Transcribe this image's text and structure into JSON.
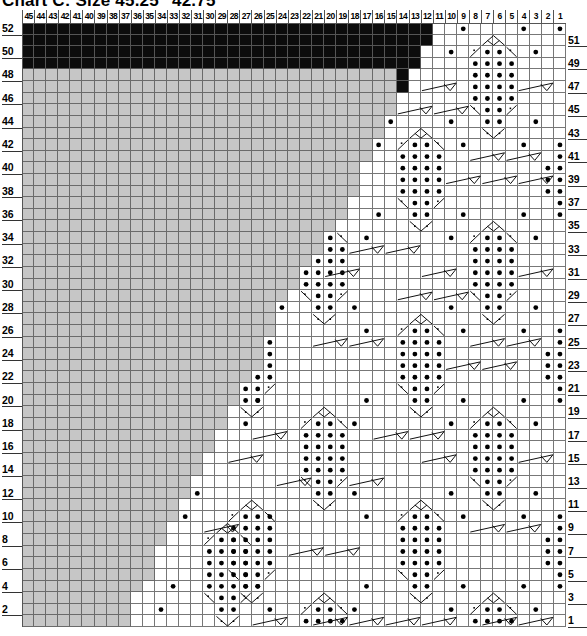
{
  "title": "Chart C: Size 45.25\" 42.75\"",
  "chart_data": {
    "type": "table",
    "subtype": "knitting-chart",
    "title": "Chart C: Size 45.25\" 42.75\"",
    "columns": 45,
    "rows": 52,
    "column_labels": [
      45,
      44,
      43,
      42,
      41,
      40,
      39,
      38,
      37,
      36,
      35,
      34,
      33,
      32,
      31,
      30,
      29,
      28,
      27,
      26,
      25,
      24,
      23,
      22,
      21,
      20,
      19,
      18,
      17,
      16,
      15,
      14,
      13,
      12,
      11,
      10,
      9,
      8,
      7,
      6,
      5,
      4,
      3,
      2,
      1
    ],
    "row_labels_left": [
      52,
      50,
      48,
      46,
      44,
      42,
      40,
      38,
      36,
      34,
      32,
      30,
      28,
      26,
      24,
      22,
      20,
      18,
      16,
      14,
      12,
      10,
      8,
      6,
      4,
      2
    ],
    "row_labels_right": [
      51,
      49,
      47,
      45,
      43,
      41,
      39,
      37,
      35,
      33,
      31,
      29,
      27,
      25,
      23,
      21,
      19,
      17,
      15,
      13,
      11,
      9,
      7,
      5,
      3,
      1
    ],
    "legend_colors": {
      "no_stitch_gray": "#c6c6c6",
      "black_bind_off": "#0c0c0c",
      "grid_line": "#777777",
      "stitch_bg": "#ffffff"
    },
    "black_cells": [
      {
        "row": 52,
        "from_col": 45,
        "to_col": 12
      },
      {
        "row": 51,
        "from_col": 45,
        "to_col": 12
      },
      {
        "row": 50,
        "from_col": 45,
        "to_col": 13
      },
      {
        "row": 49,
        "from_col": 45,
        "to_col": 13
      },
      {
        "row": 48,
        "from_col": 14,
        "to_col": 14
      },
      {
        "row": 47,
        "from_col": 14,
        "to_col": 14
      }
    ],
    "gray_through_col_by_row": {
      "48": 15,
      "47": 15,
      "46": 15,
      "45": 15,
      "44": 16,
      "43": 16,
      "42": 17,
      "41": 17,
      "40": 18,
      "39": 18,
      "38": 18,
      "37": 19,
      "36": 19,
      "35": 20,
      "34": 21,
      "33": 21,
      "32": 22,
      "31": 23,
      "30": 23,
      "29": 24,
      "28": 25,
      "27": 25,
      "26": 25,
      "25": 26,
      "24": 26,
      "23": 26,
      "22": 27,
      "21": 28,
      "20": 28,
      "19": 29,
      "18": 29,
      "17": 30,
      "16": 30,
      "15": 31,
      "14": 31,
      "13": 32,
      "12": 32,
      "11": 33,
      "10": 33,
      "9": 34,
      "8": 34,
      "7": 35,
      "6": 35,
      "5": 35,
      "4": 36,
      "3": 37,
      "2": 37,
      "1": 37
    },
    "diamond_motifs": [
      {
        "cols": [
          8,
          7,
          6,
          5
        ],
        "top_row": 51
      },
      {
        "cols": [
          8,
          7,
          6,
          5
        ],
        "top_row": 35
      },
      {
        "cols": [
          8,
          7,
          6,
          5
        ],
        "top_row": 19
      },
      {
        "cols": [
          8,
          7,
          6,
          5
        ],
        "top_row": 3
      },
      {
        "cols": [
          14,
          13,
          12,
          11
        ],
        "top_row": 43
      },
      {
        "cols": [
          14,
          13,
          12,
          11
        ],
        "top_row": 27
      },
      {
        "cols": [
          14,
          13,
          12,
          11
        ],
        "top_row": 11
      },
      {
        "cols": [
          22,
          21,
          20,
          19
        ],
        "top_row": 35
      },
      {
        "cols": [
          22,
          21,
          20,
          19
        ],
        "top_row": 19
      },
      {
        "cols": [
          22,
          21,
          20,
          19
        ],
        "top_row": 3
      },
      {
        "cols": [
          28,
          27,
          26,
          25
        ],
        "top_row": 27
      },
      {
        "cols": [
          28,
          27,
          26,
          25
        ],
        "top_row": 11
      },
      {
        "cols": [
          30,
          29,
          28,
          27
        ],
        "top_row": 9
      }
    ],
    "extra_bullets": {
      "52": [
        9,
        4,
        1
      ],
      "50": [
        10,
        3
      ],
      "44": [
        10,
        3,
        15
      ],
      "42": [
        16,
        9,
        4,
        1
      ],
      "41": [
        1
      ],
      "40": [
        2,
        1
      ],
      "39": [
        2,
        1
      ],
      "38": [
        2,
        1
      ],
      "37": [
        1
      ],
      "36": [
        16,
        9,
        4,
        1
      ],
      "34": [
        17,
        10,
        3
      ],
      "28": [
        24,
        18,
        10,
        3
      ],
      "26": [
        25,
        17,
        9,
        4,
        1
      ],
      "25": [
        1
      ],
      "24": [
        2,
        1
      ],
      "23": [
        2,
        1
      ],
      "22": [
        2,
        1
      ],
      "21": [
        1
      ],
      "20": [
        26,
        17,
        9,
        4,
        1
      ],
      "18": [
        27,
        18,
        10,
        3
      ],
      "12": [
        31,
        18,
        10,
        3
      ],
      "10": [
        32,
        25,
        17,
        9,
        4,
        1
      ],
      "9": [
        1
      ],
      "8": [
        2,
        1
      ],
      "7": [
        2,
        1
      ],
      "6": [
        2,
        1
      ],
      "5": [
        1
      ],
      "4": [
        33,
        26,
        17,
        9,
        4,
        1
      ],
      "2": [
        34,
        25,
        18,
        10,
        3
      ]
    },
    "cables": [
      {
        "row": 47,
        "from_col": 12,
        "to_col": 10
      },
      {
        "row": 47,
        "from_col": 4,
        "to_col": 2
      },
      {
        "row": 45,
        "from_col": 14,
        "to_col": 12
      },
      {
        "row": 45,
        "from_col": 11,
        "to_col": 9
      },
      {
        "row": 41,
        "from_col": 8,
        "to_col": 6
      },
      {
        "row": 41,
        "from_col": 5,
        "to_col": 3
      },
      {
        "row": 39,
        "from_col": 10,
        "to_col": 8
      },
      {
        "row": 39,
        "from_col": 7,
        "to_col": 5
      },
      {
        "row": 39,
        "from_col": 4,
        "to_col": 2
      },
      {
        "row": 33,
        "from_col": 18,
        "to_col": 16
      },
      {
        "row": 33,
        "from_col": 15,
        "to_col": 13
      },
      {
        "row": 31,
        "from_col": 12,
        "to_col": 10
      },
      {
        "row": 31,
        "from_col": 4,
        "to_col": 2
      },
      {
        "row": 31,
        "from_col": 20,
        "to_col": 18
      },
      {
        "row": 29,
        "from_col": 14,
        "to_col": 12
      },
      {
        "row": 29,
        "from_col": 11,
        "to_col": 9
      },
      {
        "row": 25,
        "from_col": 8,
        "to_col": 6
      },
      {
        "row": 25,
        "from_col": 5,
        "to_col": 3
      },
      {
        "row": 25,
        "from_col": 21,
        "to_col": 19
      },
      {
        "row": 25,
        "from_col": 18,
        "to_col": 16
      },
      {
        "row": 23,
        "from_col": 10,
        "to_col": 8
      },
      {
        "row": 23,
        "from_col": 7,
        "to_col": 5
      },
      {
        "row": 17,
        "from_col": 26,
        "to_col": 24
      },
      {
        "row": 17,
        "from_col": 16,
        "to_col": 14
      },
      {
        "row": 17,
        "from_col": 13,
        "to_col": 11
      },
      {
        "row": 15,
        "from_col": 28,
        "to_col": 26
      },
      {
        "row": 15,
        "from_col": 12,
        "to_col": 10
      },
      {
        "row": 15,
        "from_col": 4,
        "to_col": 2
      },
      {
        "row": 13,
        "from_col": 24,
        "to_col": 22
      },
      {
        "row": 13,
        "from_col": 18,
        "to_col": 16
      },
      {
        "row": 9,
        "from_col": 30,
        "to_col": 28
      },
      {
        "row": 9,
        "from_col": 8,
        "to_col": 6
      },
      {
        "row": 9,
        "from_col": 5,
        "to_col": 3
      },
      {
        "row": 7,
        "from_col": 23,
        "to_col": 21
      },
      {
        "row": 7,
        "from_col": 20,
        "to_col": 18
      },
      {
        "row": 1,
        "from_col": 26,
        "to_col": 24
      },
      {
        "row": 1,
        "from_col": 21,
        "to_col": 19
      },
      {
        "row": 1,
        "from_col": 18,
        "to_col": 16
      },
      {
        "row": 1,
        "from_col": 15,
        "to_col": 13
      },
      {
        "row": 1,
        "from_col": 12,
        "to_col": 10
      },
      {
        "row": 1,
        "from_col": 7,
        "to_col": 5
      },
      {
        "row": 1,
        "from_col": 4,
        "to_col": 2
      }
    ]
  }
}
